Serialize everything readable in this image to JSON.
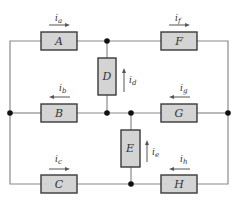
{
  "diagram": {
    "type": "circuit",
    "colors": {
      "wire": "#8a8a8a",
      "box_fill": "#d4d4d4",
      "box_stroke": "#3a3a3a",
      "node": "#111111"
    },
    "elements": [
      {
        "id": "A",
        "label": "A",
        "current": "i",
        "sub": "a",
        "direction": "right"
      },
      {
        "id": "B",
        "label": "B",
        "current": "i",
        "sub": "b",
        "direction": "left"
      },
      {
        "id": "C",
        "label": "C",
        "current": "i",
        "sub": "c",
        "direction": "right"
      },
      {
        "id": "D",
        "label": "D",
        "current": "i",
        "sub": "d",
        "direction": "up"
      },
      {
        "id": "E",
        "label": "E",
        "current": "i",
        "sub": "e",
        "direction": "up"
      },
      {
        "id": "F",
        "label": "F",
        "current": "i",
        "sub": "f",
        "direction": "right"
      },
      {
        "id": "G",
        "label": "G",
        "current": "i",
        "sub": "g",
        "direction": "left"
      },
      {
        "id": "H",
        "label": "H",
        "current": "i",
        "sub": "h",
        "direction": "left"
      }
    ]
  }
}
